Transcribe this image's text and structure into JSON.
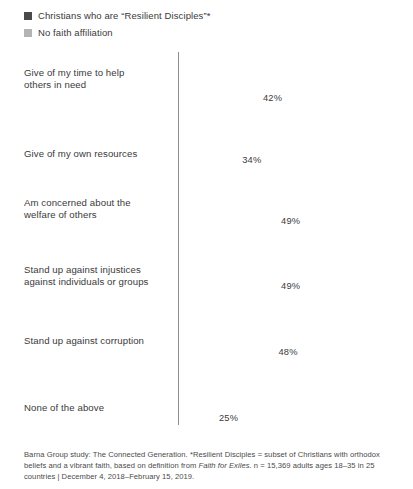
{
  "legend": {
    "items": [
      {
        "label": "Christians who are “Resilient Disciples”*",
        "color": "#4a4a4a",
        "key": "resilient-disciples"
      },
      {
        "label": "No faith affiliation",
        "color": "#b4b4b4",
        "key": "no-faith-affiliation"
      }
    ]
  },
  "footnote": {
    "part1": "Barna Group study: The Connected Generation. *Resilient Disciples = subset of Christians with orthodox beliefs and a vibrant faith, based on definition from ",
    "italic1": "Faith for Exiles",
    "part2": ". n = 15,369 adults ages 18–35 in 25 countries | December 4, 2018–February 15, 2019."
  },
  "chart_data": {
    "type": "bar",
    "orientation": "horizontal",
    "title": "",
    "xlabel": "",
    "ylabel": "",
    "xlim": [
      0,
      100
    ],
    "grid": false,
    "legend_position": "top-left",
    "axis_line": true,
    "categories": [
      "Give of my time to help others in need",
      "Give of my own resources",
      "Am concerned about the welfare of others",
      "Stand up against injustices against individuals or groups",
      "Stand up against corruption",
      "None of the above"
    ],
    "category_lines": [
      [
        "Give of my time to help",
        "others in need"
      ],
      [
        "Give of my own resources"
      ],
      [
        "Am concerned about the",
        "welfare of others"
      ],
      [
        "Stand up against injustices",
        "against individuals or groups"
      ],
      [
        "Stand up against corruption"
      ],
      [
        "None of the above"
      ]
    ],
    "series": [
      {
        "name": "Christians who are “Resilient Disciples”*",
        "color": "#4a4a4a",
        "values": [
          85,
          74,
          72,
          59,
          58,
          1
        ],
        "labels": [
          "85%",
          "74%",
          "72%",
          "59%",
          "58%",
          ""
        ]
      },
      {
        "name": "No faith affiliation",
        "color": "#b4b4b4",
        "values": [
          42,
          34,
          49,
          49,
          48,
          25
        ],
        "labels": [
          "42%",
          "34%",
          "49%",
          "49%",
          "48%",
          "25%"
        ]
      }
    ]
  }
}
